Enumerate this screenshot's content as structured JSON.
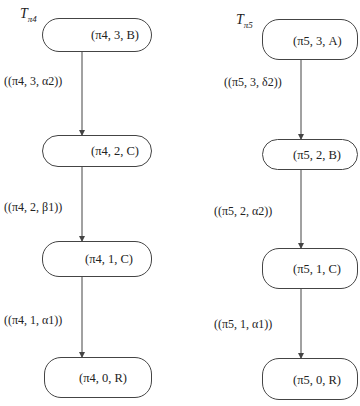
{
  "trees": [
    {
      "title": "T",
      "title_sub": "π4",
      "nodes": [
        {
          "label": "(π4, 3, B)"
        },
        {
          "label": "(π4, 2, C)"
        },
        {
          "label": "(π4, 1, C)"
        },
        {
          "label": "(π4, 0, R)"
        }
      ],
      "edges": [
        {
          "label": "((π4, 3, α2))"
        },
        {
          "label": "((π4, 2, β1))"
        },
        {
          "label": "((π4, 1, α1))"
        }
      ]
    },
    {
      "title": "T",
      "title_sub": "π5",
      "nodes": [
        {
          "label": "(π5, 3, A)"
        },
        {
          "label": "(π5, 2, B)"
        },
        {
          "label": "(π5, 1, C)"
        },
        {
          "label": "(π5, 0, R)"
        }
      ],
      "edges": [
        {
          "label": "((π5, 3, δ2))"
        },
        {
          "label": "((π5, 2, α2))"
        },
        {
          "label": "((π5, 1, α1))"
        }
      ]
    }
  ],
  "colors": {
    "line": "#444444",
    "text": "#222222",
    "background": "#ffffff"
  }
}
